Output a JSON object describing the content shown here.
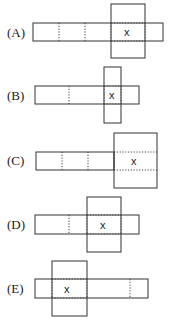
{
  "options": [
    {
      "label": "(A)",
      "description": "Strip of 5 cells; large square attached over 4th cell, extending above and below; X in 4th cell",
      "mark": "x",
      "mark_cell": 4
    },
    {
      "label": "(B)",
      "description": "Strip with narrow vertical bar crossing near right end; X at crossing",
      "mark": "x",
      "mark_cell": 3
    },
    {
      "label": "(C)",
      "description": "Strip of 3 cells attached to a large square on the right; X in square center",
      "mark": "x",
      "mark_cell": 4
    },
    {
      "label": "(D)",
      "description": "Strip with large square crossing in the middle-right; X in square center",
      "mark": "x",
      "mark_cell": 3
    },
    {
      "label": "(E)",
      "description": "Large square near left end crossing a long strip; X in square center",
      "mark": "x",
      "mark_cell": 2
    }
  ]
}
